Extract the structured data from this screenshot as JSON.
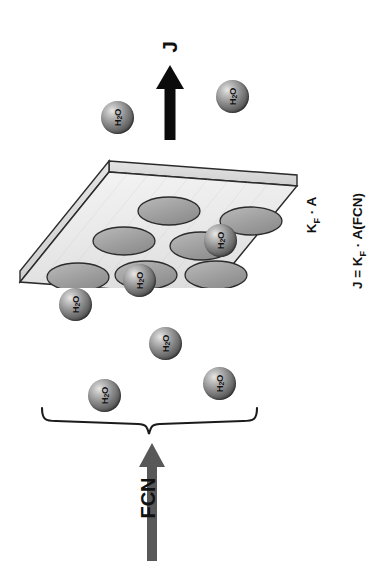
{
  "figure": {
    "type": "schematic-diagram",
    "orientation": "rotated-90-ccw",
    "background_color": "#ffffff"
  },
  "labels": {
    "flux_label": "J",
    "driving_force_label": "FCN",
    "equation_line_1": "KF · A",
    "equation_line_1_display": "KF · A",
    "equation_line_2_display": "J = KF · A(FCN)"
  },
  "equations": {
    "term_symbol": "K",
    "term_subscript": "F",
    "dot": "·",
    "area_symbol": "A",
    "line1": {
      "lhs": "",
      "rhs": "K_F · A"
    },
    "line2": {
      "lhs": "J",
      "rhs": "K_F · A(FCN)"
    }
  },
  "molecule": {
    "formula_text": "H",
    "formula_sub": "2",
    "formula_tail": "O",
    "label": "H2O",
    "count": 8,
    "fill_dark": "#2c2c2c",
    "fill_light": "#e8e8e8"
  },
  "molecules": [
    {
      "name": "molecule-upper-left",
      "x": 101,
      "y": 101,
      "d": 33
    },
    {
      "name": "molecule-upper-right",
      "x": 216,
      "y": 80,
      "d": 33
    },
    {
      "name": "molecule-membrane-right",
      "x": 204,
      "y": 224,
      "d": 33
    },
    {
      "name": "molecule-membrane-bottom",
      "x": 123,
      "y": 264,
      "d": 33
    },
    {
      "name": "molecule-left-below",
      "x": 59,
      "y": 288,
      "d": 33
    },
    {
      "name": "molecule-center-below",
      "x": 149,
      "y": 327,
      "d": 33
    },
    {
      "name": "molecule-lower-left",
      "x": 88,
      "y": 379,
      "d": 33
    },
    {
      "name": "molecule-lower-right",
      "x": 203,
      "y": 367,
      "d": 33
    }
  ],
  "membrane": {
    "name": "porous-membrane-slab",
    "surface_color": "#eeeeee",
    "edge_color": "#d6d6d6",
    "outline_color": "#2b2b2b",
    "pore_count": 7,
    "pore_color": "#9a9a9a",
    "pores": [
      {
        "cx": 161,
        "cy": 63,
        "rx": 31,
        "ry": 14
      },
      {
        "cx": 243,
        "cy": 73,
        "rx": 31,
        "ry": 14
      },
      {
        "cx": 116,
        "cy": 93,
        "rx": 31,
        "ry": 14
      },
      {
        "cx": 193,
        "cy": 98,
        "rx": 31,
        "ry": 14
      },
      {
        "cx": 70,
        "cy": 129,
        "rx": 31,
        "ry": 14
      },
      {
        "cx": 138,
        "cy": 127,
        "rx": 31,
        "ry": 14
      },
      {
        "cx": 208,
        "cy": 127,
        "rx": 31,
        "ry": 14
      }
    ]
  },
  "arrows": {
    "flux_arrow": {
      "name": "flux-arrow-J",
      "color": "#0b0b0b",
      "direction": "up"
    },
    "driving_arrow": {
      "name": "driving-force-arrow-FCN",
      "color": "#585858",
      "direction": "up"
    }
  },
  "brace": {
    "name": "grouping-brace",
    "color": "#1b1b1b",
    "orientation": "horizontal",
    "groups": "feed-side water molecules"
  }
}
